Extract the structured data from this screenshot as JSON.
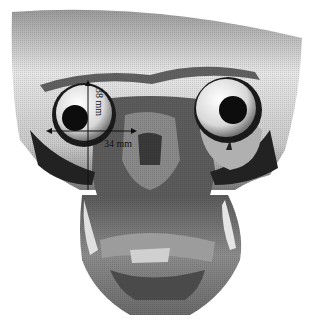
{
  "figure": {
    "measurements": [
      {
        "id": "vertical",
        "label": "38 mm",
        "orientation": "vertical"
      },
      {
        "id": "horizontal",
        "label": "34 mm",
        "orientation": "horizontal"
      }
    ]
  }
}
